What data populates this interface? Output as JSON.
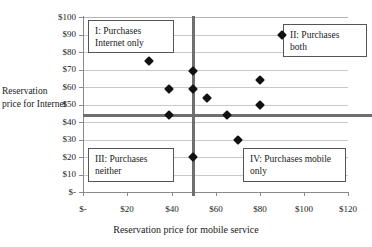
{
  "chart_data": {
    "type": "scatter",
    "title": "",
    "xlabel": "Reservation price for mobile service",
    "ylabel": "Reservation price for Internet",
    "xlim": [
      0,
      120
    ],
    "ylim": [
      0,
      100
    ],
    "grid": true,
    "legend_position": "none",
    "x_tick_labels": [
      "$-",
      "$20",
      "$40",
      "$60",
      "$80",
      "$100",
      "$120"
    ],
    "x_tick_values": [
      0,
      20,
      40,
      60,
      80,
      100,
      120
    ],
    "y_tick_labels": [
      "$-",
      "$10",
      "$20",
      "$30",
      "$40",
      "$50",
      "$60",
      "$70",
      "$80",
      "$90",
      "$100"
    ],
    "y_tick_values": [
      0,
      10,
      20,
      30,
      40,
      50,
      60,
      70,
      80,
      90,
      100
    ],
    "marker_color": "#111111",
    "threshold_color": "#6f6f6f",
    "points": [
      {
        "x": 30,
        "y": 75
      },
      {
        "x": 90,
        "y": 90
      },
      {
        "x": 50,
        "y": 69
      },
      {
        "x": 80,
        "y": 64
      },
      {
        "x": 39,
        "y": 59
      },
      {
        "x": 50,
        "y": 59
      },
      {
        "x": 56,
        "y": 54
      },
      {
        "x": 80,
        "y": 50
      },
      {
        "x": 39,
        "y": 44
      },
      {
        "x": 65,
        "y": 44
      },
      {
        "x": 70,
        "y": 30
      },
      {
        "x": 50,
        "y": 20
      }
    ],
    "thresholds": {
      "vertical_x": 50,
      "horizontal_y": 44
    },
    "annotations": [
      {
        "id": "I",
        "text": "I: Purchases\nInternet only"
      },
      {
        "id": "II",
        "text": "II: Purchases\nboth"
      },
      {
        "id": "III",
        "text": "III: Purchases\nneither"
      },
      {
        "id": "IV",
        "text": "IV: Purchases mobile\nonly"
      }
    ]
  }
}
